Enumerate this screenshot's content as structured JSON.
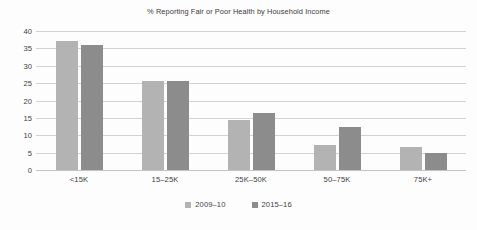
{
  "chart_data": {
    "type": "bar",
    "title": "% Reporting Fair or Poor Health by Household Income",
    "xlabel": "",
    "ylabel": "",
    "categories": [
      "<15K",
      "15–25K",
      "25K–50K",
      "50–75K",
      "75K+"
    ],
    "series": [
      {
        "name": "2009–10",
        "color": "#b3b3b3",
        "values": [
          37,
          25.5,
          14.5,
          7.2,
          6.5
        ]
      },
      {
        "name": "2015–16",
        "color": "#8c8c8c",
        "values": [
          36,
          25.5,
          16.5,
          12.5,
          5
        ]
      }
    ],
    "ylim": [
      0,
      40
    ],
    "yticks": [
      "40",
      "35",
      "30",
      "25",
      "20",
      "15",
      "10",
      "5",
      "0"
    ],
    "ytick_values": [
      40,
      35,
      30,
      25,
      20,
      15,
      10,
      5,
      0
    ],
    "grid": true,
    "legend_position": "bottom",
    "legend": [
      "2009–10",
      "2015–16"
    ]
  },
  "colors": {
    "background": "#fdfdfd",
    "gridline": "#d2d2d2",
    "baseline": "#c3c3c3",
    "text": "#3d3d3d",
    "title_text": "#3b3b3b",
    "series_1": "#b3b3b3",
    "series_2": "#8c8c8c"
  }
}
